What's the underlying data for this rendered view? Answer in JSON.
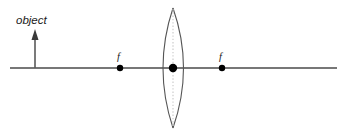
{
  "canvas": {
    "width": 347,
    "height": 135,
    "background": "#ffffff"
  },
  "colors": {
    "axis": "#4a4a4a",
    "lens_outline": "#555555",
    "lens_center_line": "#cccccc",
    "point_marker": "#000000",
    "arrow": "#5a5a5a",
    "text": "#1a1a1a",
    "clipped_text": "#c9c9c9"
  },
  "labels": {
    "object": "object",
    "focal_left": "f",
    "focal_right": "f",
    "clipped_top_fragment": ""
  },
  "chart_data": {
    "type": "diagram",
    "title": "",
    "optical_axis": {
      "y": 68,
      "x_start": 10,
      "x_end": 337
    },
    "lens": {
      "shape": "biconvex",
      "center_x": 173,
      "center_y": 68,
      "top_apex_y": 8,
      "bottom_apex_y": 128,
      "left_edge_x": 155,
      "right_edge_x": 192,
      "has_dotted_center_line": true
    },
    "points": [
      {
        "name": "focal-point-left",
        "label": "f",
        "x": 120,
        "y": 68,
        "radius": 3.2
      },
      {
        "name": "lens-center",
        "label": "",
        "x": 173,
        "y": 68,
        "radius": 4.2
      },
      {
        "name": "focal-point-right",
        "label": "f",
        "x": 222,
        "y": 68,
        "radius": 3.2
      }
    ],
    "object_arrow": {
      "label": "object",
      "base_x": 35,
      "base_y": 68,
      "tip_y": 31,
      "head_width": 7,
      "head_height": 9,
      "direction": "up"
    },
    "label_positions": {
      "object": {
        "x": 16,
        "y": 24
      },
      "focal_left": {
        "x": 117,
        "y": 60
      },
      "focal_right": {
        "x": 219,
        "y": 60
      }
    }
  }
}
